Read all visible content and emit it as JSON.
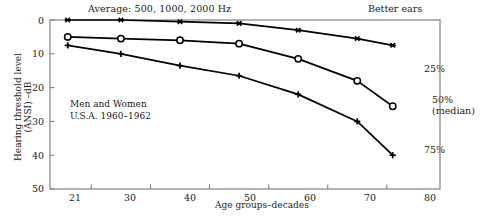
{
  "titles": {
    "average": "Average:  500, 1000, 2000 Hz",
    "better_ears": "Better ears"
  },
  "annotation": {
    "line1": "Men and Women",
    "line2": "U.S.A. 1960–1962"
  },
  "axes": {
    "ylabel": "Hearing threshold level (ANSI) –dB",
    "xlabel": "Age groups–decades",
    "yticks": [
      "0",
      "10",
      "20",
      "30",
      "40",
      "50"
    ],
    "xticks": [
      "21",
      "30",
      "40",
      "50",
      "60",
      "70",
      "80"
    ]
  },
  "series_labels": {
    "p25": "25%",
    "p50": "50%",
    "p50_sub": "(median)",
    "p75": "75%"
  },
  "colors": {
    "line": "#000000",
    "frame": "#808080",
    "text": "#1a1a1a"
  },
  "chart_data": {
    "type": "line",
    "title": "Average:  500, 1000, 2000 Hz",
    "subtitle": "Better ears",
    "xlabel": "Age groups–decades",
    "ylabel": "Hearing threshold level (ANSI) –dB",
    "xlim": [
      18,
      84
    ],
    "ylim": [
      0,
      50
    ],
    "y_inverted": true,
    "grid": false,
    "legend": "right-inline",
    "annotations": [
      "Men and Women",
      "U.S.A. 1960–1962"
    ],
    "x": [
      21,
      30,
      40,
      50,
      60,
      70,
      76
    ],
    "series": [
      {
        "name": "25%",
        "marker": "asterisk",
        "values": [
          0,
          0,
          0.5,
          1,
          3,
          5.5,
          7.5
        ]
      },
      {
        "name": "50% (median)",
        "marker": "circle",
        "values": [
          5,
          5.5,
          6,
          7,
          11.5,
          18,
          25.5
        ]
      },
      {
        "name": "75%",
        "marker": "plus",
        "values": [
          7.5,
          10,
          13.5,
          16.5,
          22,
          30,
          40
        ]
      }
    ]
  }
}
